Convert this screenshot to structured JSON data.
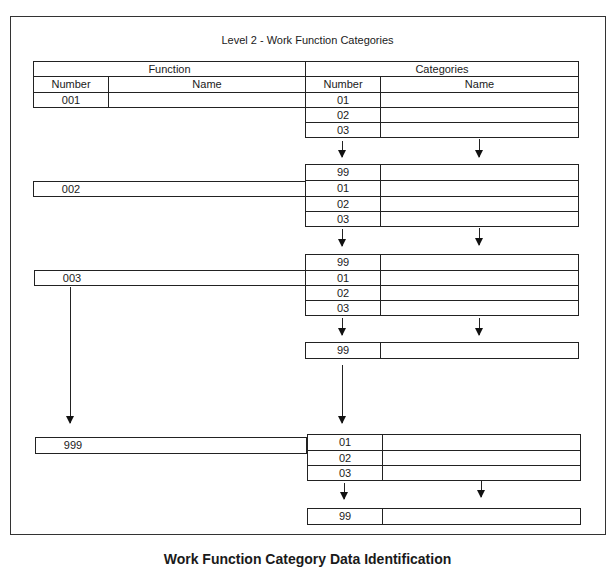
{
  "title": "Level 2 - Work Function  Categories",
  "table_header": {
    "group_function": "Function",
    "group_categories": "Categories",
    "function_number": "Number",
    "function_name": "Name",
    "category_number": "Number",
    "category_name": "Name"
  },
  "functions": [
    {
      "number": "001",
      "name": ""
    },
    {
      "number": "002",
      "name": ""
    },
    {
      "number": "003",
      "name": ""
    },
    {
      "number": "999",
      "name": ""
    }
  ],
  "category_blocks": [
    {
      "rows": [
        {
          "number": "01"
        },
        {
          "number": "02"
        },
        {
          "number": "03"
        }
      ],
      "end": {
        "number": "99"
      }
    },
    {
      "rows": [
        {
          "number": "99"
        },
        {
          "number": "01"
        },
        {
          "number": "02"
        },
        {
          "number": "03"
        }
      ]
    },
    {
      "rows": [
        {
          "number": "99"
        },
        {
          "number": "01"
        },
        {
          "number": "02"
        },
        {
          "number": "03"
        }
      ],
      "end": {
        "number": "99"
      }
    },
    {
      "rows": [
        {
          "number": "01"
        },
        {
          "number": "02"
        },
        {
          "number": "03"
        }
      ],
      "end": {
        "number": "99"
      }
    }
  ],
  "caption": "Work Function Category Data Identification"
}
